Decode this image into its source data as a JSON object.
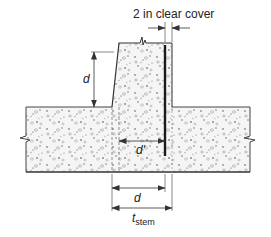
{
  "diagram": {
    "labels": {
      "clear_cover": "2 in clear cover",
      "d_vertical": "d",
      "d_prime": "d'",
      "d_bottom": "d",
      "t_stem_main": "t",
      "t_stem_sub": "stem"
    },
    "colors": {
      "line": "#333333",
      "rebar": "#1a1a1a",
      "concrete_fill": "#f4f4f4",
      "aggregate": "#777777"
    }
  }
}
